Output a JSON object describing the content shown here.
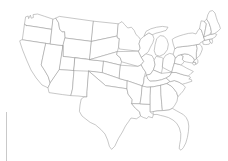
{
  "document": {
    "kind": "blank-outline-map",
    "title": "Blank map of the contiguous United States",
    "region": "United States (lower 48 states)",
    "projection": "albers-like",
    "has_labels": false,
    "has_legend": false,
    "has_title_text": false
  },
  "canvas": {
    "width": 228,
    "height": 161,
    "background_color": "#ffffff"
  },
  "style": {
    "border_color": "#9a9a9a",
    "fill_color": "#ffffff",
    "border_width": 0.55,
    "artifact_color": "#c9c9c9"
  },
  "artifacts": [
    {
      "name": "scan-line",
      "description": "faint vertical gray scan line near left edge",
      "x": 6,
      "y": 112,
      "width": 1,
      "height": 49
    }
  ],
  "states": [
    {
      "code": "WA",
      "name": "Washington"
    },
    {
      "code": "OR",
      "name": "Oregon"
    },
    {
      "code": "CA",
      "name": "California"
    },
    {
      "code": "NV",
      "name": "Nevada"
    },
    {
      "code": "ID",
      "name": "Idaho"
    },
    {
      "code": "MT",
      "name": "Montana"
    },
    {
      "code": "WY",
      "name": "Wyoming"
    },
    {
      "code": "UT",
      "name": "Utah"
    },
    {
      "code": "AZ",
      "name": "Arizona"
    },
    {
      "code": "NM",
      "name": "New Mexico"
    },
    {
      "code": "CO",
      "name": "Colorado"
    },
    {
      "code": "ND",
      "name": "North Dakota"
    },
    {
      "code": "SD",
      "name": "South Dakota"
    },
    {
      "code": "NE",
      "name": "Nebraska"
    },
    {
      "code": "KS",
      "name": "Kansas"
    },
    {
      "code": "OK",
      "name": "Oklahoma"
    },
    {
      "code": "TX",
      "name": "Texas"
    },
    {
      "code": "MN",
      "name": "Minnesota"
    },
    {
      "code": "IA",
      "name": "Iowa"
    },
    {
      "code": "MO",
      "name": "Missouri"
    },
    {
      "code": "AR",
      "name": "Arkansas"
    },
    {
      "code": "LA",
      "name": "Louisiana"
    },
    {
      "code": "WI",
      "name": "Wisconsin"
    },
    {
      "code": "IL",
      "name": "Illinois"
    },
    {
      "code": "MI",
      "name": "Michigan"
    },
    {
      "code": "IN",
      "name": "Indiana"
    },
    {
      "code": "OH",
      "name": "Ohio"
    },
    {
      "code": "KY",
      "name": "Kentucky"
    },
    {
      "code": "TN",
      "name": "Tennessee"
    },
    {
      "code": "MS",
      "name": "Mississippi"
    },
    {
      "code": "AL",
      "name": "Alabama"
    },
    {
      "code": "GA",
      "name": "Georgia"
    },
    {
      "code": "FL",
      "name": "Florida"
    },
    {
      "code": "SC",
      "name": "South Carolina"
    },
    {
      "code": "NC",
      "name": "North Carolina"
    },
    {
      "code": "VA",
      "name": "Virginia"
    },
    {
      "code": "WV",
      "name": "West Virginia"
    },
    {
      "code": "MD",
      "name": "Maryland"
    },
    {
      "code": "DE",
      "name": "Delaware"
    },
    {
      "code": "PA",
      "name": "Pennsylvania"
    },
    {
      "code": "NJ",
      "name": "New Jersey"
    },
    {
      "code": "NY",
      "name": "New York"
    },
    {
      "code": "CT",
      "name": "Connecticut"
    },
    {
      "code": "RI",
      "name": "Rhode Island"
    },
    {
      "code": "MA",
      "name": "Massachusetts"
    },
    {
      "code": "VT",
      "name": "Vermont"
    },
    {
      "code": "NH",
      "name": "New Hampshire"
    },
    {
      "code": "ME",
      "name": "Maine"
    }
  ]
}
